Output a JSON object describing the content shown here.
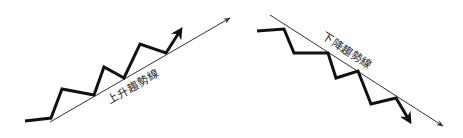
{
  "diagram": {
    "colors": {
      "background": "#ffffff",
      "price_line": "#111111",
      "trend_line": "#333333",
      "text": "#222222"
    },
    "uptrend": {
      "label": "上升趨勢線",
      "label_pos": [
        135,
        90
      ],
      "label_angle": -30,
      "price_path": [
        [
          25,
          121
        ],
        [
          51,
          118
        ],
        [
          62,
          89
        ],
        [
          94,
          95
        ],
        [
          104,
          67
        ],
        [
          124,
          78
        ],
        [
          140,
          44
        ],
        [
          166,
          53
        ],
        [
          180,
          31
        ]
      ],
      "price_arrow_tip": [
        183,
        27
      ],
      "trend_start": [
        50,
        122
      ],
      "trend_end": [
        230,
        18
      ]
    },
    "downtrend": {
      "label": "下降趨勢線",
      "label_pos": [
        345,
        54
      ],
      "label_angle": 33,
      "price_path": [
        [
          257,
          31
        ],
        [
          284,
          29
        ],
        [
          294,
          53
        ],
        [
          328,
          53
        ],
        [
          336,
          78
        ],
        [
          358,
          71
        ],
        [
          371,
          104
        ],
        [
          396,
          98
        ],
        [
          409,
          120
        ]
      ],
      "price_arrow_tip": [
        413,
        127
      ],
      "trend_start": [
        270,
        15
      ],
      "trend_end": [
        443,
        126
      ]
    }
  }
}
